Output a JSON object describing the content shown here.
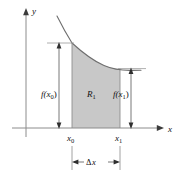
{
  "figure": {
    "axes": {
      "x_label": "x",
      "y_label": "y"
    },
    "labels": {
      "left_height": "f(x",
      "left_height_sub": "0",
      "left_height_close": ")",
      "right_height": "f(x",
      "right_height_sub": "1",
      "right_height_close": ")",
      "region": "R",
      "region_sub": "1",
      "tick_left": "x",
      "tick_left_sub": "0",
      "tick_right": "x",
      "tick_right_sub": "1",
      "delta": "Δ",
      "delta_var": "x"
    },
    "colors": {
      "shading": "#c8c8c8",
      "shading_edge": "#9a9a9a",
      "axis": "#8c8c8c",
      "curve": "#6e6e6e",
      "guide": "#9a9a9a",
      "text": "#111111",
      "background": "#ffffff"
    },
    "geometry": {
      "y_axis_x": 26,
      "x_axis_y": 128,
      "x0": 72,
      "x1": 120,
      "f_x0_y": 43,
      "f_x1_y": 68,
      "curve_start_x": 57,
      "curve_start_y": 16,
      "curve_end_x": 141,
      "curve_end_y": 70,
      "delta_bar_y": 162
    }
  }
}
